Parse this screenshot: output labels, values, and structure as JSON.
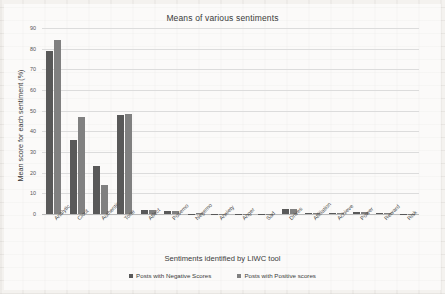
{
  "chart_data": {
    "type": "bar",
    "title": "Means of various sentiments",
    "xlabel": "Sentiments identified by LIWC tool",
    "ylabel": "Mean score for each sentiment (%)",
    "ylim": [
      0,
      90
    ],
    "ytick_step": 10,
    "yticks": [
      "0",
      "10",
      "20",
      "30",
      "40",
      "50",
      "60",
      "70",
      "80",
      "90"
    ],
    "grid": true,
    "legend_position": "bottom",
    "categories": [
      "Analytic",
      "Clout",
      "Authentic",
      "Tone",
      "Affect",
      "Posemo",
      "Negemo",
      "Anxiety",
      "Anger",
      "Sad",
      "Drives",
      "Affiliation",
      "Achieve",
      "Power",
      "Reward",
      "Risk"
    ],
    "series": [
      {
        "name": "Posts with Negative Scores",
        "color": "#595959",
        "values": [
          79,
          36,
          23,
          48,
          2,
          1.5,
          0.2,
          0.1,
          0.1,
          0.1,
          2.6,
          0.5,
          0.7,
          0.9,
          0.5,
          0.2
        ]
      },
      {
        "name": "Posts with Positive scores",
        "color": "#808080",
        "values": [
          84,
          47,
          14,
          48.5,
          2,
          1.5,
          0.4,
          0.1,
          0.1,
          0.1,
          2.6,
          0.5,
          0.7,
          1.0,
          0.3,
          0.2
        ]
      }
    ]
  }
}
